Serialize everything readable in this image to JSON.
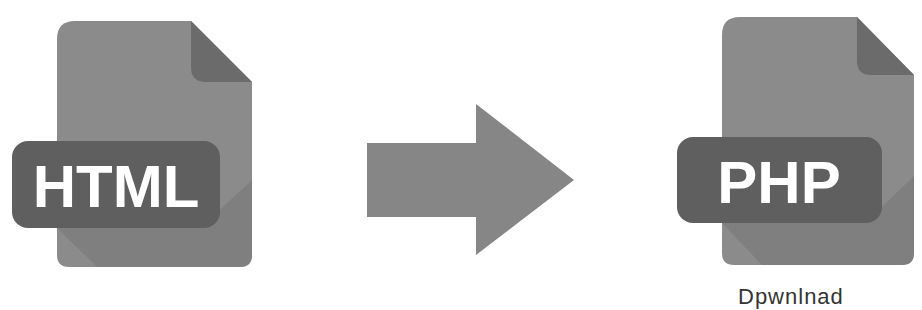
{
  "diagram": {
    "source": {
      "label": "HTML",
      "icon": "html-file-icon"
    },
    "target": {
      "label": "PHP",
      "icon": "php-file-icon"
    },
    "connector": {
      "icon": "arrow-right-icon"
    },
    "caption_partial": "Dpwnlnad"
  },
  "colors": {
    "file_body": "#8b8b8b",
    "file_fold": "#6b6b6b",
    "badge": "#5f5f5f",
    "badge_shadow": "#7a7a7a",
    "arrow": "#868686",
    "label_text": "#ffffff"
  }
}
